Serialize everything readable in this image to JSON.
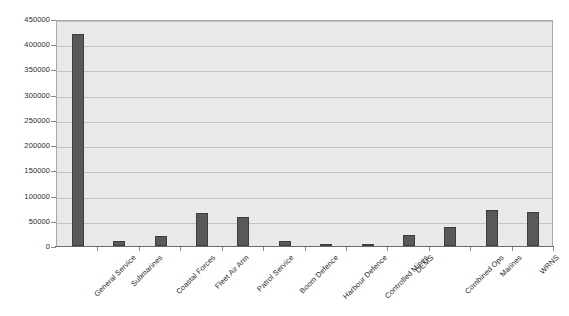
{
  "chart_data": {
    "type": "bar",
    "title": "",
    "xlabel": "",
    "ylabel": "",
    "ylim": [
      0,
      450000
    ],
    "ytick_step": 50000,
    "grid": true,
    "legend": "none",
    "categories": [
      "General Service",
      "Submarines",
      "Coastal Forces",
      "Fleet Air Arm",
      "Patrol Service",
      "Boom Defence",
      "Harbour Defence",
      "Controlled Mines",
      "DEMS",
      "Combined Ops",
      "Marines",
      "WRNS"
    ],
    "values": [
      420000,
      10000,
      20000,
      65000,
      58000,
      10000,
      2000,
      3000,
      22000,
      38000,
      72000,
      68000
    ],
    "ytick_labels": [
      "450000",
      "400000",
      "350000",
      "300000",
      "250000",
      "200000",
      "150000",
      "100000",
      "50000",
      "0"
    ],
    "ytick_values": [
      450000,
      400000,
      350000,
      300000,
      250000,
      200000,
      150000,
      100000,
      50000,
      0
    ],
    "colors": {
      "bar_fill": "#595959",
      "bar_stroke": "#3d3d3d",
      "plot_background": "#e9e9e9",
      "gridline": "#c4c4c4",
      "plot_border": "#a9a9a9",
      "axis": "#6b6b6b",
      "text": "#2b2b2b",
      "page_background": "#ffffff"
    }
  }
}
